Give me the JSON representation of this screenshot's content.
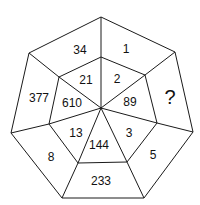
{
  "puzzle": {
    "shape": "heptagon",
    "outer_ring": [
      {
        "id": "outer-top-left",
        "value": "34",
        "x": 80,
        "y": 50
      },
      {
        "id": "outer-top-right",
        "value": "1",
        "x": 126,
        "y": 49
      },
      {
        "id": "outer-right",
        "value": "?",
        "x": 170,
        "y": 97,
        "unknown": true
      },
      {
        "id": "outer-lower-right",
        "value": "5",
        "x": 153,
        "y": 155
      },
      {
        "id": "outer-bottom",
        "value": "233",
        "x": 101,
        "y": 181
      },
      {
        "id": "outer-lower-left",
        "value": "8",
        "x": 51,
        "y": 157
      },
      {
        "id": "outer-left",
        "value": "377",
        "x": 39,
        "y": 98
      }
    ],
    "inner_ring": [
      {
        "id": "inner-top-left",
        "value": "21",
        "x": 86,
        "y": 80
      },
      {
        "id": "inner-top-right",
        "value": "2",
        "x": 117,
        "y": 79
      },
      {
        "id": "inner-right",
        "value": "89",
        "x": 130,
        "y": 102
      },
      {
        "id": "inner-lower-right",
        "value": "3",
        "x": 129,
        "y": 133
      },
      {
        "id": "inner-bottom",
        "value": "144",
        "x": 99,
        "y": 145
      },
      {
        "id": "inner-lower-left",
        "value": "13",
        "x": 76,
        "y": 133
      },
      {
        "id": "inner-left",
        "value": "610",
        "x": 72,
        "y": 103
      }
    ],
    "geometry": {
      "outer": [
        [
          101,
          17
        ],
        [
          175,
          52
        ],
        [
          193,
          132
        ],
        [
          144,
          198
        ],
        [
          62,
          198
        ],
        [
          11,
          133
        ],
        [
          29,
          53
        ]
      ],
      "inner": [
        [
          101,
          57
        ],
        [
          145,
          75
        ],
        [
          157,
          123
        ],
        [
          127,
          162
        ],
        [
          78,
          163
        ],
        [
          49,
          124
        ],
        [
          59,
          77
        ]
      ],
      "center": [
        101,
        108
      ]
    },
    "colors": {
      "line": "#1a1a1a",
      "text": "#111111",
      "background": "#ffffff"
    }
  }
}
